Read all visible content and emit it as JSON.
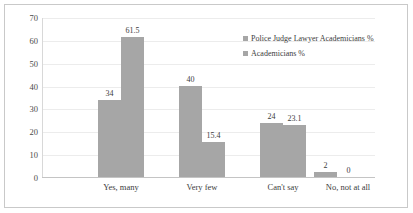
{
  "chart_data": {
    "type": "bar",
    "title": "",
    "xlabel": "",
    "ylabel": "",
    "ylim": [
      0,
      70
    ],
    "yticks": [
      "0",
      "10",
      "20",
      "30",
      "40",
      "50",
      "60",
      "70"
    ],
    "grid": true,
    "legend_position": "right",
    "bar_color": "#a6a6a6",
    "categories": [
      "Yes, many",
      "Very few",
      "Can't say",
      "No, not at all"
    ],
    "series": [
      {
        "name": "Police Judge Lawyer Academicians %",
        "values": [
          34,
          40,
          24,
          2
        ],
        "labels": [
          "34",
          "40",
          "24",
          "2"
        ]
      },
      {
        "name": "Academicians %",
        "values": [
          61.5,
          15.4,
          23.1,
          0
        ],
        "labels": [
          "61.5",
          "15.4",
          "23.1",
          "0"
        ]
      }
    ]
  },
  "legend": {
    "items": [
      {
        "label": "Police Judge Lawyer Academicians %",
        "marker": "square-marker"
      },
      {
        "label": "Academicians %",
        "marker": "square-marker"
      }
    ]
  }
}
